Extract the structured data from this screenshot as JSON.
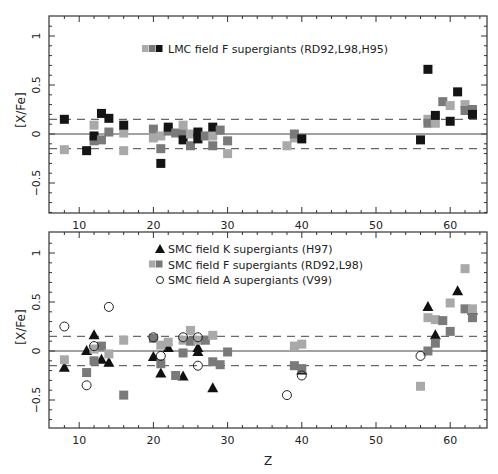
{
  "chart_data": [
    {
      "type": "scatter",
      "panel": "top",
      "title": "",
      "xlabel": "",
      "ylabel": "[X/Fe]",
      "xlim": [
        6,
        65
      ],
      "ylim": [
        -0.83,
        1.18
      ],
      "x_ticks": [
        10,
        20,
        30,
        40,
        50,
        60
      ],
      "y_ticks": [
        -0.5,
        0,
        0.5,
        1
      ],
      "y_tick_labels": [
        "-0.5",
        "0",
        "0.5",
        "1"
      ],
      "reference_lines": [
        {
          "y": 0,
          "style": "solid"
        },
        {
          "y": 0.15,
          "style": "dashed"
        },
        {
          "y": -0.15,
          "style": "dashed"
        }
      ],
      "legend": [
        {
          "label": "LMC field F supergiants (RD92,L98,H95)",
          "marker": "square",
          "colors": [
            "#aaaaaa",
            "#777777",
            "#111111"
          ]
        }
      ],
      "series": [
        {
          "name": "LMC field F supergiants (RD92,L98,H95)",
          "marker": "square",
          "points": [
            {
              "x": 8,
              "y": 0.15,
              "shade": "dark"
            },
            {
              "x": 8,
              "y": -0.16,
              "shade": "light"
            },
            {
              "x": 11,
              "y": -0.17,
              "shade": "dark"
            },
            {
              "x": 12,
              "y": 0.09,
              "shade": "light"
            },
            {
              "x": 12,
              "y": -0.07,
              "shade": "mid"
            },
            {
              "x": 12,
              "y": -0.02,
              "shade": "dark"
            },
            {
              "x": 13,
              "y": -0.06,
              "shade": "mid"
            },
            {
              "x": 13,
              "y": 0.21,
              "shade": "dark"
            },
            {
              "x": 14,
              "y": 0.02,
              "shade": "mid"
            },
            {
              "x": 14,
              "y": 0.16,
              "shade": "dark"
            },
            {
              "x": 16,
              "y": 0.01,
              "shade": "light"
            },
            {
              "x": 16,
              "y": -0.17,
              "shade": "light"
            },
            {
              "x": 16,
              "y": 0.09,
              "shade": "dark"
            },
            {
              "x": 20,
              "y": 0.05,
              "shade": "mid"
            },
            {
              "x": 20,
              "y": -0.04,
              "shade": "light"
            },
            {
              "x": 21,
              "y": -0.02,
              "shade": "light"
            },
            {
              "x": 21,
              "y": -0.15,
              "shade": "mid"
            },
            {
              "x": 21,
              "y": -0.3,
              "shade": "dark"
            },
            {
              "x": 22,
              "y": 0.03,
              "shade": "mid"
            },
            {
              "x": 22,
              "y": 0.07,
              "shade": "dark"
            },
            {
              "x": 23,
              "y": 0.01,
              "shade": "mid"
            },
            {
              "x": 24,
              "y": 0.09,
              "shade": "light"
            },
            {
              "x": 24,
              "y": 0.0,
              "shade": "mid"
            },
            {
              "x": 24,
              "y": -0.06,
              "shade": "dark"
            },
            {
              "x": 25,
              "y": 0.0,
              "shade": "light"
            },
            {
              "x": 25,
              "y": -0.12,
              "shade": "mid"
            },
            {
              "x": 26,
              "y": -0.02,
              "shade": "mid"
            },
            {
              "x": 26,
              "y": 0.02,
              "shade": "dark"
            },
            {
              "x": 26,
              "y": -0.05,
              "shade": "dark"
            },
            {
              "x": 27,
              "y": -0.02,
              "shade": "mid"
            },
            {
              "x": 28,
              "y": -0.02,
              "shade": "light"
            },
            {
              "x": 28,
              "y": -0.12,
              "shade": "mid"
            },
            {
              "x": 28,
              "y": 0.07,
              "shade": "dark"
            },
            {
              "x": 29,
              "y": 0.04,
              "shade": "mid"
            },
            {
              "x": 30,
              "y": -0.07,
              "shade": "mid"
            },
            {
              "x": 30,
              "y": -0.2,
              "shade": "light"
            },
            {
              "x": 38,
              "y": -0.12,
              "shade": "light"
            },
            {
              "x": 39,
              "y": -0.04,
              "shade": "light"
            },
            {
              "x": 39,
              "y": 0.0,
              "shade": "mid"
            },
            {
              "x": 40,
              "y": -0.05,
              "shade": "dark"
            },
            {
              "x": 56,
              "y": -0.06,
              "shade": "dark"
            },
            {
              "x": 57,
              "y": 0.15,
              "shade": "light"
            },
            {
              "x": 57,
              "y": 0.11,
              "shade": "mid"
            },
            {
              "x": 57,
              "y": 0.66,
              "shade": "dark"
            },
            {
              "x": 58,
              "y": 0.11,
              "shade": "light"
            },
            {
              "x": 58,
              "y": 0.19,
              "shade": "dark"
            },
            {
              "x": 59,
              "y": 0.33,
              "shade": "mid"
            },
            {
              "x": 60,
              "y": 0.29,
              "shade": "light"
            },
            {
              "x": 60,
              "y": 0.13,
              "shade": "dark"
            },
            {
              "x": 61,
              "y": 0.43,
              "shade": "dark"
            },
            {
              "x": 62,
              "y": 0.3,
              "shade": "light"
            },
            {
              "x": 62,
              "y": 0.24,
              "shade": "mid"
            },
            {
              "x": 63,
              "y": 0.25,
              "shade": "mid"
            },
            {
              "x": 63,
              "y": 0.2,
              "shade": "dark"
            }
          ]
        }
      ]
    },
    {
      "type": "scatter",
      "panel": "bottom",
      "title": "",
      "xlabel": "Z",
      "ylabel": "[X/Fe]",
      "xlim": [
        6,
        65
      ],
      "ylim": [
        -0.83,
        1.18
      ],
      "x_ticks": [
        10,
        20,
        30,
        40,
        50,
        60
      ],
      "y_ticks": [
        -0.5,
        0,
        0.5,
        1
      ],
      "y_tick_labels": [
        "-0.5",
        "0",
        "0.5",
        "1"
      ],
      "reference_lines": [
        {
          "y": 0,
          "style": "solid"
        },
        {
          "y": 0.15,
          "style": "dashed"
        },
        {
          "y": -0.15,
          "style": "dashed"
        }
      ],
      "legend": [
        {
          "label": "SMC field K supergiants (H97)",
          "marker": "triangle",
          "colors": [
            "#111111"
          ]
        },
        {
          "label": "SMC field F supergiants (RD92,L98)",
          "marker": "square",
          "colors": [
            "#aaaaaa",
            "#777777"
          ]
        },
        {
          "label": "SMC field A supergiants (V99)",
          "marker": "circle-open",
          "colors": [
            "#222222"
          ]
        }
      ],
      "series": [
        {
          "name": "SMC field K supergiants (H97)",
          "marker": "triangle",
          "points": [
            {
              "x": 8,
              "y": -0.17
            },
            {
              "x": 11,
              "y": 0.0
            },
            {
              "x": 12,
              "y": 0.16
            },
            {
              "x": 13,
              "y": -0.09
            },
            {
              "x": 14,
              "y": -0.12
            },
            {
              "x": 20,
              "y": -0.06
            },
            {
              "x": 21,
              "y": -0.23
            },
            {
              "x": 22,
              "y": 0.03
            },
            {
              "x": 24,
              "y": -0.26
            },
            {
              "x": 26,
              "y": 0.03
            },
            {
              "x": 26,
              "y": -0.01
            },
            {
              "x": 28,
              "y": -0.38
            },
            {
              "x": 40,
              "y": -0.2
            },
            {
              "x": 57,
              "y": 0.45
            },
            {
              "x": 58,
              "y": 0.16
            },
            {
              "x": 61,
              "y": 0.61
            },
            {
              "x": 63,
              "y": 0.41
            }
          ]
        },
        {
          "name": "SMC field F supergiants (RD92,L98)",
          "marker": "square",
          "points": [
            {
              "x": 8,
              "y": -0.09,
              "shade": "light"
            },
            {
              "x": 11,
              "y": -0.22,
              "shade": "mid"
            },
            {
              "x": 12,
              "y": 0.02,
              "shade": "light"
            },
            {
              "x": 12,
              "y": -0.1,
              "shade": "mid"
            },
            {
              "x": 13,
              "y": 0.05,
              "shade": "mid"
            },
            {
              "x": 14,
              "y": -0.03,
              "shade": "light"
            },
            {
              "x": 16,
              "y": 0.11,
              "shade": "light"
            },
            {
              "x": 16,
              "y": -0.45,
              "shade": "mid"
            },
            {
              "x": 20,
              "y": 0.13,
              "shade": "mid"
            },
            {
              "x": 21,
              "y": 0.06,
              "shade": "light"
            },
            {
              "x": 21,
              "y": -0.13,
              "shade": "mid"
            },
            {
              "x": 22,
              "y": 0.09,
              "shade": "light"
            },
            {
              "x": 23,
              "y": -0.25,
              "shade": "mid"
            },
            {
              "x": 24,
              "y": 0.11,
              "shade": "light"
            },
            {
              "x": 24,
              "y": -0.02,
              "shade": "mid"
            },
            {
              "x": 25,
              "y": 0.21,
              "shade": "light"
            },
            {
              "x": 25,
              "y": 0.1,
              "shade": "mid"
            },
            {
              "x": 26,
              "y": 0.11,
              "shade": "light"
            },
            {
              "x": 27,
              "y": 0.11,
              "shade": "mid"
            },
            {
              "x": 28,
              "y": 0.16,
              "shade": "light"
            },
            {
              "x": 28,
              "y": -0.11,
              "shade": "mid"
            },
            {
              "x": 29,
              "y": -0.14,
              "shade": "mid"
            },
            {
              "x": 30,
              "y": -0.01,
              "shade": "mid"
            },
            {
              "x": 39,
              "y": 0.05,
              "shade": "light"
            },
            {
              "x": 39,
              "y": -0.15,
              "shade": "mid"
            },
            {
              "x": 40,
              "y": 0.07,
              "shade": "light"
            },
            {
              "x": 40,
              "y": -0.18,
              "shade": "mid"
            },
            {
              "x": 56,
              "y": -0.36,
              "shade": "light"
            },
            {
              "x": 57,
              "y": 0.0,
              "shade": "mid"
            },
            {
              "x": 57,
              "y": 0.34,
              "shade": "light"
            },
            {
              "x": 58,
              "y": 0.08,
              "shade": "mid"
            },
            {
              "x": 58,
              "y": 0.32,
              "shade": "light"
            },
            {
              "x": 59,
              "y": 0.31,
              "shade": "mid"
            },
            {
              "x": 60,
              "y": 0.49,
              "shade": "light"
            },
            {
              "x": 60,
              "y": 0.2,
              "shade": "mid"
            },
            {
              "x": 62,
              "y": 0.84,
              "shade": "light"
            },
            {
              "x": 62,
              "y": 0.43,
              "shade": "mid"
            },
            {
              "x": 63,
              "y": 0.43,
              "shade": "light"
            },
            {
              "x": 63,
              "y": 0.34,
              "shade": "mid"
            }
          ]
        },
        {
          "name": "SMC field A supergiants (V99)",
          "marker": "circle-open",
          "points": [
            {
              "x": 8,
              "y": 0.25
            },
            {
              "x": 11,
              "y": -0.35
            },
            {
              "x": 12,
              "y": 0.05
            },
            {
              "x": 14,
              "y": 0.45
            },
            {
              "x": 20,
              "y": 0.14
            },
            {
              "x": 21,
              "y": -0.05
            },
            {
              "x": 24,
              "y": 0.14
            },
            {
              "x": 26,
              "y": 0.14
            },
            {
              "x": 26,
              "y": -0.15
            },
            {
              "x": 38,
              "y": -0.45
            },
            {
              "x": 40,
              "y": -0.25
            },
            {
              "x": 56,
              "y": -0.05
            }
          ]
        }
      ]
    }
  ],
  "shade_colors": {
    "light": "#a9a9a9",
    "mid": "#7a7a7a",
    "dark": "#141414"
  },
  "axis": {
    "x_label": "Z",
    "y_label": "[X/Fe]"
  }
}
